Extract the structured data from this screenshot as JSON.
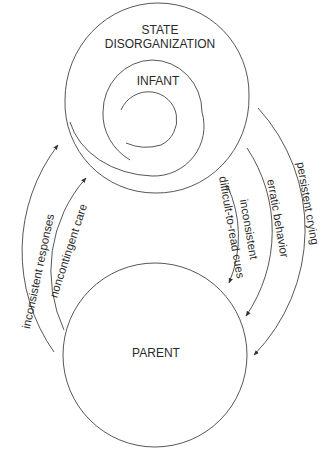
{
  "diagram": {
    "nodes": {
      "top_title_line1": "STATE",
      "top_title_line2": "DISORGANIZATION",
      "infant": "INFANT",
      "parent": "PARENT"
    },
    "edges": {
      "parent_to_infant_outer": "inconsistent responses",
      "parent_to_infant_inner": "noncontingent care",
      "infant_to_parent_inner_line1": "inconsistent",
      "infant_to_parent_inner_line2": "difficult-to-read cues",
      "infant_to_parent_middle": "erratic behavior",
      "infant_to_parent_outer": "persistent crying"
    },
    "colors": {
      "line": "#444444",
      "text": "#2a2a2a",
      "background": "#ffffff"
    }
  }
}
